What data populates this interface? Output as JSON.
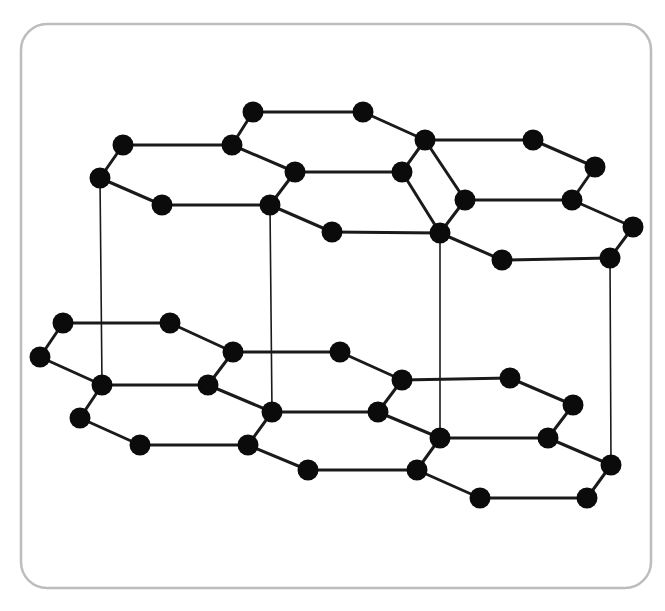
{
  "figure": {
    "kind": "molecular-lattice-diagram",
    "background_color": "#ffffff",
    "width": 665,
    "height": 611
  },
  "panel": {
    "name": "rounded-panel-border",
    "x": 21,
    "y": 24,
    "width": 630,
    "height": 564,
    "corner_radius": 26,
    "stroke_color": "#bdbdbd",
    "stroke_width": 2.5,
    "fill": "none"
  },
  "style": {
    "atom_color": "#0b0b0b",
    "atom_radius": 10.5,
    "bond_color": "#1a1a1a",
    "in_plane_bond_width": 3.0,
    "interlayer_bond_width": 1.6
  },
  "structure": {
    "description": "Two stacked hexagonal carbon sheets connected by four vertical interlayer bonds",
    "layers": [
      {
        "id": "upper-layer",
        "label": "Upper graphene sheet",
        "atom_count": 28
      },
      {
        "id": "lower-layer",
        "label": "Lower graphene sheet",
        "atom_count": 28
      }
    ],
    "interlayer_bond_count": 4
  },
  "chart_data": {
    "type": "scatter",
    "xlabel": "",
    "ylabel": "",
    "xlim": [
      0,
      665
    ],
    "ylim": [
      0,
      611
    ],
    "grid": false,
    "legend": null,
    "atoms": {
      "upper_layer": [
        {
          "id": "u1",
          "x": 123,
          "y": 145
        },
        {
          "id": "u2",
          "x": 100,
          "y": 178
        },
        {
          "id": "u3",
          "x": 162,
          "y": 205
        },
        {
          "id": "u4",
          "x": 232,
          "y": 145
        },
        {
          "id": "u5",
          "x": 253,
          "y": 112
        },
        {
          "id": "u6",
          "x": 363,
          "y": 112
        },
        {
          "id": "u7",
          "x": 295,
          "y": 172
        },
        {
          "id": "u8",
          "x": 270,
          "y": 205
        },
        {
          "id": "u9",
          "x": 332,
          "y": 232
        },
        {
          "id": "u10",
          "x": 425,
          "y": 140
        },
        {
          "id": "u11",
          "x": 402,
          "y": 172
        },
        {
          "id": "u12",
          "x": 440,
          "y": 233
        },
        {
          "id": "u13",
          "x": 465,
          "y": 200
        },
        {
          "id": "u14",
          "x": 533,
          "y": 140
        },
        {
          "id": "u15",
          "x": 595,
          "y": 167
        },
        {
          "id": "u16",
          "x": 572,
          "y": 200
        },
        {
          "id": "u17",
          "x": 502,
          "y": 260
        },
        {
          "id": "u18",
          "x": 610,
          "y": 258
        },
        {
          "id": "u19",
          "x": 633,
          "y": 227
        }
      ],
      "lower_layer": [
        {
          "id": "l1",
          "x": 63,
          "y": 323
        },
        {
          "id": "l2",
          "x": 170,
          "y": 323
        },
        {
          "id": "l3",
          "x": 40,
          "y": 357
        },
        {
          "id": "l4",
          "x": 102,
          "y": 385
        },
        {
          "id": "l5",
          "x": 208,
          "y": 385
        },
        {
          "id": "l6",
          "x": 233,
          "y": 352
        },
        {
          "id": "l7",
          "x": 80,
          "y": 418
        },
        {
          "id": "l8",
          "x": 140,
          "y": 445
        },
        {
          "id": "l9",
          "x": 248,
          "y": 445
        },
        {
          "id": "l10",
          "x": 272,
          "y": 412
        },
        {
          "id": "l11",
          "x": 340,
          "y": 352
        },
        {
          "id": "l12",
          "x": 402,
          "y": 380
        },
        {
          "id": "l13",
          "x": 378,
          "y": 412
        },
        {
          "id": "l14",
          "x": 308,
          "y": 470
        },
        {
          "id": "l15",
          "x": 417,
          "y": 470
        },
        {
          "id": "l16",
          "x": 440,
          "y": 438
        },
        {
          "id": "l17",
          "x": 510,
          "y": 378
        },
        {
          "id": "l18",
          "x": 573,
          "y": 405
        },
        {
          "id": "l19",
          "x": 548,
          "y": 438
        },
        {
          "id": "l20",
          "x": 480,
          "y": 498
        },
        {
          "id": "l21",
          "x": 587,
          "y": 498
        },
        {
          "id": "l22",
          "x": 611,
          "y": 465
        }
      ]
    },
    "bonds": {
      "upper_layer": [
        [
          "u5",
          "u6"
        ],
        [
          "u5",
          "u4"
        ],
        [
          "u4",
          "u1"
        ],
        [
          "u1",
          "u2"
        ],
        [
          "u2",
          "u3"
        ],
        [
          "u3",
          "u8"
        ],
        [
          "u8",
          "u7"
        ],
        [
          "u7",
          "u4"
        ],
        [
          "u6",
          "u10"
        ],
        [
          "u10",
          "u11"
        ],
        [
          "u11",
          "u7"
        ],
        [
          "u8",
          "u9"
        ],
        [
          "u9",
          "u12"
        ],
        [
          "u12",
          "u11"
        ],
        [
          "u10",
          "u14"
        ],
        [
          "u14",
          "u15"
        ],
        [
          "u15",
          "u16"
        ],
        [
          "u16",
          "u13"
        ],
        [
          "u13",
          "u12"
        ],
        [
          "u12",
          "u17"
        ],
        [
          "u17",
          "u18"
        ],
        [
          "u18",
          "u19"
        ],
        [
          "u19",
          "u16"
        ],
        [
          "u13",
          "u10"
        ]
      ],
      "lower_layer": [
        [
          "l1",
          "l2"
        ],
        [
          "l1",
          "l3"
        ],
        [
          "l3",
          "l4"
        ],
        [
          "l4",
          "l5"
        ],
        [
          "l5",
          "l6"
        ],
        [
          "l6",
          "l2"
        ],
        [
          "l4",
          "l7"
        ],
        [
          "l7",
          "l8"
        ],
        [
          "l8",
          "l9"
        ],
        [
          "l9",
          "l10"
        ],
        [
          "l10",
          "l5"
        ],
        [
          "l6",
          "l11"
        ],
        [
          "l11",
          "l12"
        ],
        [
          "l12",
          "l13"
        ],
        [
          "l13",
          "l10"
        ],
        [
          "l9",
          "l14"
        ],
        [
          "l14",
          "l15"
        ],
        [
          "l15",
          "l16"
        ],
        [
          "l16",
          "l13"
        ],
        [
          "l12",
          "l17"
        ],
        [
          "l17",
          "l18"
        ],
        [
          "l18",
          "l19"
        ],
        [
          "l19",
          "l16"
        ],
        [
          "l15",
          "l20"
        ],
        [
          "l20",
          "l21"
        ],
        [
          "l21",
          "l22"
        ],
        [
          "l22",
          "l19"
        ]
      ],
      "interlayer": [
        [
          "u2",
          "l4"
        ],
        [
          "u8",
          "l10"
        ],
        [
          "u12",
          "l16"
        ],
        [
          "u18",
          "l22"
        ]
      ]
    }
  }
}
